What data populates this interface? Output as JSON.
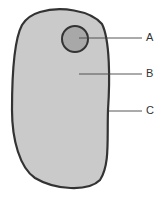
{
  "diagram": {
    "type": "cell",
    "colors": {
      "cytoplasm": "#cacaca",
      "nucleus": "#a8a8a8",
      "outline": "#333333",
      "leader": "#444444"
    },
    "labels": [
      {
        "id": "A",
        "text": "A",
        "points_to": "nucleus"
      },
      {
        "id": "B",
        "text": "B",
        "points_to": "cytoplasm"
      },
      {
        "id": "C",
        "text": "C",
        "points_to": "cell-membrane"
      }
    ]
  }
}
